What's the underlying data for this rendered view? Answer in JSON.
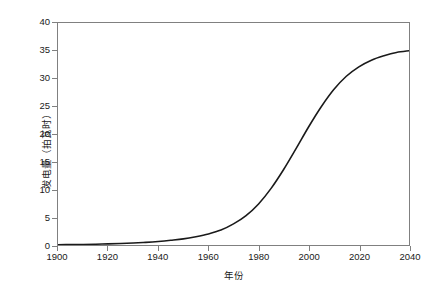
{
  "chart_data": {
    "type": "line",
    "title": "",
    "xlabel": "年份",
    "ylabel": "发电量（拍瓦时）",
    "xlim": [
      1900,
      2040
    ],
    "ylim": [
      0,
      40
    ],
    "grid": false,
    "legend": null,
    "xticks": [
      "1900",
      "1920",
      "1940",
      "1960",
      "1980",
      "2000",
      "2020",
      "2040"
    ],
    "xtick_values": [
      1900,
      1920,
      1940,
      1960,
      1980,
      2000,
      2020,
      2040
    ],
    "yticks": [
      "0",
      "5",
      "10",
      "15",
      "20",
      "25",
      "30",
      "35",
      "40"
    ],
    "ytick_values": [
      0,
      5,
      10,
      15,
      20,
      25,
      30,
      35,
      40
    ],
    "series": [
      {
        "name": "发电量",
        "color": "#1a1a1a",
        "x": [
          1900,
          1905,
          1910,
          1915,
          1920,
          1925,
          1930,
          1935,
          1940,
          1945,
          1950,
          1955,
          1960,
          1965,
          1970,
          1975,
          1980,
          1985,
          1990,
          1995,
          2000,
          2005,
          2010,
          2015,
          2020,
          2025,
          2030,
          2035,
          2040
        ],
        "values": [
          0.05,
          0.07,
          0.1,
          0.14,
          0.2,
          0.27,
          0.36,
          0.48,
          0.64,
          0.85,
          1.1,
          1.5,
          2.0,
          2.7,
          3.8,
          5.3,
          7.4,
          10.2,
          13.6,
          17.4,
          21.3,
          24.9,
          28.0,
          30.4,
          32.1,
          33.3,
          34.1,
          34.7,
          35.0
        ]
      }
    ]
  },
  "axes": {
    "frame_color": "#808080",
    "background": "#ffffff"
  }
}
